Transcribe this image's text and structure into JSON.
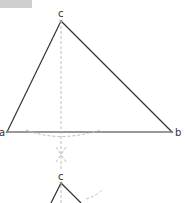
{
  "diagram": {
    "header_badge": {
      "text": ""
    },
    "main_triangle": {
      "vertices": {
        "a": {
          "label": "a",
          "x": 7,
          "y": 132
        },
        "b": {
          "label": "b",
          "x": 172,
          "y": 132
        },
        "c": {
          "label": "c",
          "x": 61,
          "y": 21
        }
      },
      "altitude": {
        "style": "dashed",
        "from": "c",
        "to_y": 170
      },
      "construction_arc": {
        "style": "dashed"
      }
    },
    "sub_triangle": {
      "apex": {
        "label": "c",
        "x": 61,
        "y": 182
      }
    },
    "colors": {
      "edge": "#333333",
      "construction": "#b5b5b5",
      "badge": "#cfcfcf"
    }
  }
}
